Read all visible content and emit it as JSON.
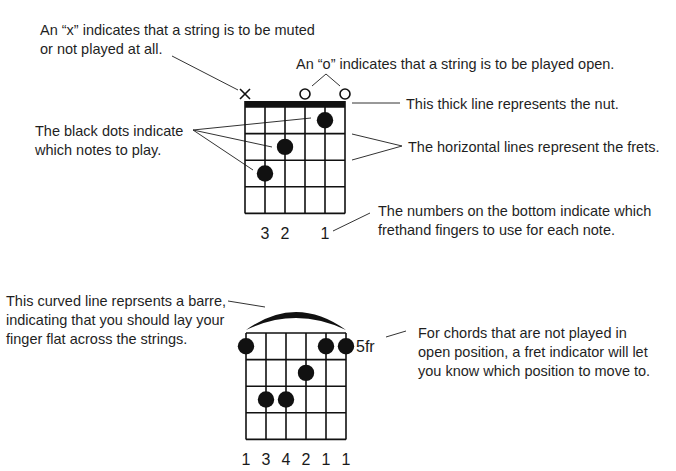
{
  "annotations": {
    "x_marker": [
      "An “x” indicates that a string is to be muted",
      "or not played at all."
    ],
    "o_marker": [
      "An “o” indicates that a string is to be played open."
    ],
    "nut": [
      "This thick line represents the nut."
    ],
    "dots": [
      "The black dots indicate",
      "which notes to play."
    ],
    "frets": [
      "The horizontal lines represent the frets."
    ],
    "fingers": [
      "The numbers on the bottom indicate which",
      "frethand fingers to use for each note."
    ],
    "barre": [
      "This curved line reprsents a barre,",
      "indicating that you should lay your",
      "finger flat across the strings."
    ],
    "fret_indicator": [
      "For chords that are not played in",
      "open position, a fret indicator will let",
      "you know which position to move to."
    ]
  },
  "chord_open": {
    "strings": 6,
    "frets_shown": 4,
    "has_nut": true,
    "string_markers": [
      "x",
      "",
      "",
      "o",
      "",
      "o"
    ],
    "dots": [
      {
        "string": 5,
        "fret": 1
      },
      {
        "string": 3,
        "fret": 2
      },
      {
        "string": 2,
        "fret": 3
      }
    ],
    "fingers": [
      "",
      "3",
      "2",
      "",
      "1",
      ""
    ]
  },
  "chord_barre": {
    "strings": 6,
    "frets_shown": 4,
    "has_nut": false,
    "fret_label": "5fr",
    "barre": {
      "from_string": 1,
      "to_string": 6,
      "fret": 1
    },
    "dots": [
      {
        "string": 1,
        "fret": 1
      },
      {
        "string": 5,
        "fret": 1
      },
      {
        "string": 6,
        "fret": 1
      },
      {
        "string": 4,
        "fret": 2
      },
      {
        "string": 2,
        "fret": 3
      },
      {
        "string": 3,
        "fret": 3
      }
    ],
    "fingers": [
      "1",
      "3",
      "4",
      "2",
      "1",
      "1"
    ]
  }
}
